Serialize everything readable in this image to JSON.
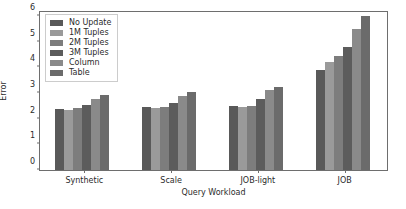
{
  "chart_data": {
    "type": "bar",
    "title": "",
    "xlabel": "Query Workload",
    "ylabel": "Error",
    "categories": [
      "Synthetic",
      "Scale",
      "JOB-light",
      "JOB"
    ],
    "series": [
      {
        "name": "No Update",
        "color": "#595959",
        "values": [
          2.37,
          2.47,
          2.5,
          3.88
        ]
      },
      {
        "name": "1M Tuples",
        "color": "#9a9a9a",
        "values": [
          2.32,
          2.43,
          2.46,
          4.2
        ]
      },
      {
        "name": "2M Tuples",
        "color": "#7d7d7d",
        "values": [
          2.4,
          2.46,
          2.5,
          4.43
        ]
      },
      {
        "name": "3M Tuples",
        "color": "#5c5c5c",
        "values": [
          2.55,
          2.62,
          2.78,
          4.78
        ]
      },
      {
        "name": "Column",
        "color": "#8a8a8a",
        "values": [
          2.78,
          2.88,
          3.1,
          5.47
        ]
      },
      {
        "name": "Table",
        "color": "#6b6b6b",
        "values": [
          2.93,
          3.03,
          3.23,
          6.0
        ]
      }
    ],
    "ylim": [
      0,
      6.15
    ],
    "yticks": [
      0,
      1,
      2,
      3,
      4,
      5,
      6
    ],
    "ytick_labels": [
      "0",
      "1",
      "2",
      "3",
      "4",
      "5",
      "6"
    ],
    "grid": false,
    "legend_position": "upper left",
    "frame": true,
    "axis_color": "#6e6e6e",
    "text_color": "#2b2b2b",
    "background": "#ffffff"
  }
}
